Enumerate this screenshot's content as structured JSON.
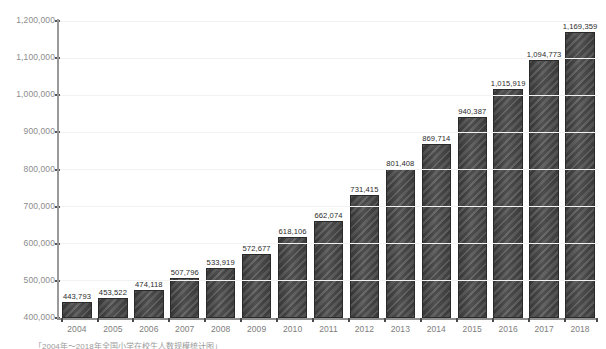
{
  "chart_data": {
    "type": "bar",
    "title": "",
    "subtitle": "",
    "xlabel": "",
    "ylabel": "",
    "categories": [
      "2004",
      "2005",
      "2006",
      "2007",
      "2008",
      "2009",
      "2010",
      "2011",
      "2012",
      "2013",
      "2014",
      "2015",
      "2016",
      "2017",
      "2018"
    ],
    "values": [
      443793,
      453522,
      474118,
      507796,
      533919,
      572677,
      618106,
      662074,
      731415,
      801408,
      869714,
      940387,
      1015919,
      1094773,
      1169359
    ],
    "value_labels": [
      "443,793",
      "453,522",
      "474,118",
      "507,796",
      "533,919",
      "572,677",
      "618,106",
      "662,074",
      "731,415",
      "801,408",
      "869,714",
      "940,387",
      "1,015,919",
      "1,094,773",
      "1,169,359"
    ],
    "ylim": [
      400000,
      1200000
    ],
    "ytick_values": [
      400000,
      500000,
      600000,
      700000,
      800000,
      900000,
      1000000,
      1100000,
      1200000
    ],
    "ytick_labels": [
      "400,000",
      "500,000",
      "600,000",
      "700,000",
      "800,000",
      "900,000",
      "1,000,000",
      "1,100,000",
      "1,200,000"
    ],
    "grid": true,
    "grid_axis": "y",
    "legend": false,
    "legend_position": "none",
    "bar_color": "#4a4a4a",
    "bar_edge_color": "#2a2a2a",
    "axis_color": "#8f8f8f",
    "grid_color": "#f2f2f2",
    "tick_label_color": "#7d7d7d",
    "value_label_color": "#2b2b2b",
    "background_color": "#ffffff",
    "data_labels_shown": true,
    "series": [
      {
        "name": "",
        "values": [
          443793,
          453522,
          474118,
          507796,
          533919,
          572677,
          618106,
          662074,
          731415,
          801408,
          869714,
          940387,
          1015919,
          1094773,
          1169359
        ]
      }
    ]
  },
  "caption": {
    "text": "「2004年～2018年全国小学在校生人数规模统计图」"
  }
}
